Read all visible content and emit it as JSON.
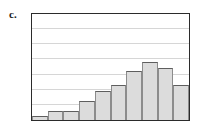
{
  "figure": {
    "label": "c."
  },
  "chart_data": {
    "type": "bar",
    "title": "",
    "xlabel": "",
    "ylabel": "",
    "grid": true,
    "legend": null,
    "categories": [
      "1",
      "2",
      "3",
      "4",
      "5",
      "6",
      "7",
      "8",
      "9",
      "10"
    ],
    "values": [
      4,
      9,
      9,
      19,
      29,
      35,
      49,
      57,
      52,
      35
    ],
    "ylim": [
      0,
      105
    ],
    "xlim": [
      0,
      10
    ],
    "gridline_values": [
      15,
      30,
      45,
      60,
      75,
      90
    ],
    "tick_labels_x": [],
    "tick_labels_y": [],
    "colors": {
      "bar_fill": "#dcdcdc",
      "bar_edge": "#5e5e5e",
      "frame": "#2b2b2b",
      "gridline": "#d6d6d6",
      "background": "#ffffff",
      "label_text": "#1a1a1a"
    }
  }
}
